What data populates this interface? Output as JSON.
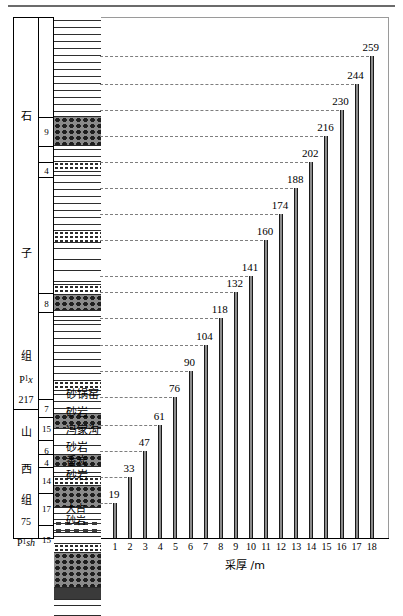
{
  "figure": {
    "xlabel": "采厚 /m",
    "frame_color": "#9a9a9a"
  },
  "chart_data": {
    "type": "bar",
    "title": "",
    "xlabel": "采厚 /m",
    "ylabel": "",
    "categories": [
      "1",
      "2",
      "3",
      "4",
      "5",
      "6",
      "7",
      "8",
      "9",
      "10",
      "11",
      "12",
      "13",
      "14",
      "15",
      "16",
      "17",
      "18"
    ],
    "values": [
      19,
      33,
      47,
      61,
      76,
      90,
      104,
      118,
      132,
      141,
      160,
      174,
      188,
      202,
      216,
      230,
      244,
      259
    ],
    "ylim": [
      0,
      272
    ],
    "grid": "horizontal-dashed-to-strata-column",
    "legend": "none",
    "bar_color": "#4a4a4a"
  },
  "strata": {
    "eras": [
      {
        "label": "石",
        "top": 0,
        "height": 118
      },
      {
        "label": "子",
        "top": 118,
        "height": 170
      },
      {
        "label": "组",
        "top": 288,
        "height": 54
      },
      {
        "label": "P₁x",
        "top": 342,
        "height": 27
      },
      {
        "label": "217",
        "top": 369,
        "height": 27
      },
      {
        "label": "山",
        "top": 396,
        "height": 35
      },
      {
        "label": "西",
        "top": 431,
        "height": 42
      },
      {
        "label": "组",
        "top": 473,
        "height": 27
      },
      {
        "label": "75",
        "top": 500,
        "height": 28
      },
      {
        "label": "P₁sh",
        "top": 528,
        "height": 36
      }
    ],
    "bed_numbers": [
      {
        "label": "9",
        "top": 100,
        "height": 30
      },
      {
        "label": "4",
        "top": 148,
        "height": 12
      },
      {
        "label": "8",
        "top": 274,
        "height": 16
      },
      {
        "label": "7",
        "top": 396,
        "height": 20
      },
      {
        "label": "15",
        "top": 420,
        "height": 26
      },
      {
        "label": "6",
        "top": 446,
        "height": 14
      },
      {
        "label": "4",
        "top": 460,
        "height": 11
      },
      {
        "label": "14",
        "top": 471,
        "height": 30
      },
      {
        "label": "17",
        "top": 476,
        "height": 34
      },
      {
        "label": "15",
        "top": 502,
        "height": 34
      }
    ],
    "lithology_names": [
      {
        "label": "砂锅窑",
        "y": 390
      },
      {
        "label": "砂岩",
        "y": 408
      },
      {
        "label": "冯家沟",
        "y": 426
      },
      {
        "label": "砂岩",
        "y": 443
      },
      {
        "label": "香炭",
        "y": 457
      },
      {
        "label": "砂岩",
        "y": 471
      },
      {
        "label": "大占",
        "y": 505
      },
      {
        "label": "砂岩",
        "y": 517
      }
    ]
  }
}
